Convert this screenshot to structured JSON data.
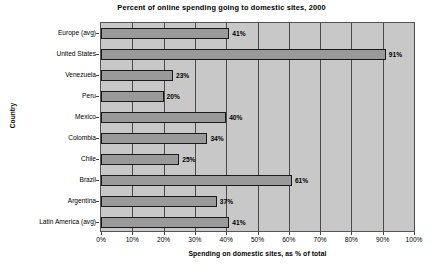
{
  "chart_data": {
    "type": "bar",
    "orientation": "horizontal",
    "title": "Percent of online spending going to domestic sites, 2000",
    "xlabel": "Spending on domestic sites, as % of total",
    "ylabel": "Country",
    "categories": [
      "Europe (avg)",
      "United States",
      "Venezuela",
      "Peru",
      "Mexico",
      "Colombia",
      "Chile",
      "Brazil",
      "Argentina",
      "Latin America (avg)"
    ],
    "values": [
      41,
      91,
      23,
      20,
      40,
      34,
      25,
      61,
      37,
      41
    ],
    "value_labels": [
      "41%",
      "91%",
      "23%",
      "20%",
      "40%",
      "34%",
      "25%",
      "61%",
      "37%",
      "41%"
    ],
    "xlim": [
      0,
      100
    ],
    "xticks": [
      0,
      10,
      20,
      30,
      40,
      50,
      60,
      70,
      80,
      90,
      100
    ],
    "xtick_labels": [
      "0%",
      "10%",
      "20%",
      "30%",
      "40%",
      "50%",
      "60%",
      "70%",
      "80%",
      "90%",
      "100%"
    ],
    "grid": true,
    "grid_axis": "x",
    "legend": false,
    "colors": {
      "bar_fill": "#9a9a9a",
      "bar_border": "#1a1a1a",
      "plot_background": "#c8c8c8",
      "gridline": "#4a4a4a",
      "page_background": "#ffffff",
      "text": "#000000"
    }
  }
}
